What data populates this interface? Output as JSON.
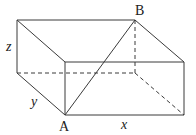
{
  "diagram": {
    "type": "rectangular-box-3d",
    "labels": {
      "point_a": "A",
      "point_b": "B",
      "length_x": "x",
      "width_y": "y",
      "height_z": "z"
    },
    "vertices": {
      "top_back_left": [
        17,
        20
      ],
      "top_back_right_B": [
        135,
        20
      ],
      "top_front_left": [
        65,
        62
      ],
      "top_front_right": [
        184,
        62
      ],
      "bottom_back_left": [
        17,
        73
      ],
      "bottom_back_right": [
        135,
        73
      ],
      "bottom_front_left_A": [
        65,
        115
      ],
      "bottom_front_right": [
        184,
        115
      ]
    },
    "diagonal": {
      "from": "A",
      "to": "B",
      "style": "solid"
    },
    "hidden_edges_style": "dashed",
    "colors": {
      "line": "#3a3a3a",
      "text": "#222222",
      "background": "#ffffff"
    }
  }
}
